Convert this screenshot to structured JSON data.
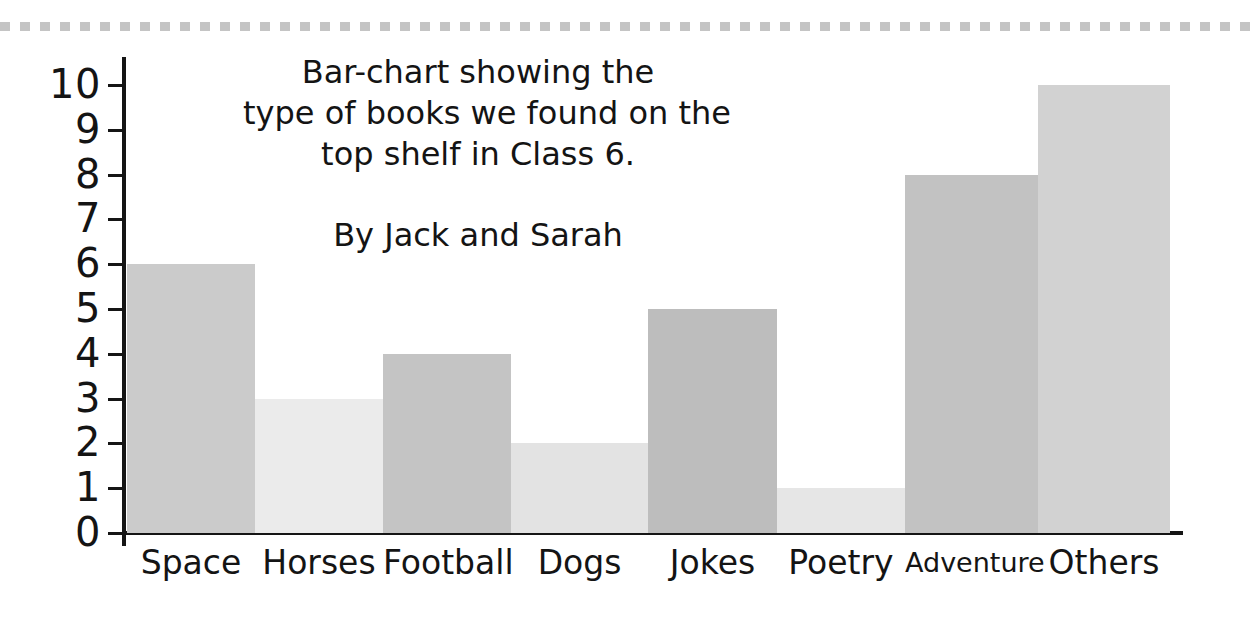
{
  "decoration": {
    "top_border_name": "dashed-border",
    "dash_color": "#c4c4c4"
  },
  "title": {
    "lines": [
      "Bar-chart showing the",
      "type of books we found on the",
      "top shelf in Class 6."
    ],
    "byline": "By Jack and Sarah"
  },
  "axes": {
    "y_ticks": [
      "10",
      "9",
      "8",
      "7",
      "6",
      "5",
      "4",
      "3",
      "2",
      "1",
      "0"
    ],
    "axis_color": "#151515"
  },
  "chart_data": {
    "type": "bar",
    "subtitle": "By Jack and Sarah",
    "xlabel": "",
    "ylabel": "",
    "categories": [
      "Space",
      "Horses",
      "Football",
      "Dogs",
      "Jokes",
      "Poetry",
      "Adventure",
      "Others"
    ],
    "values": [
      6,
      3,
      4,
      2,
      5,
      1,
      8,
      10
    ],
    "ylim": [
      0,
      10
    ],
    "ytick_step": 1,
    "grid": false,
    "legend": "none",
    "bar_colors": [
      "#cbcbcb",
      "#ebebeb",
      "#c4c4c4",
      "#e3e3e3",
      "#bdbdbd",
      "#e6e6e6",
      "#c2c2c2",
      "#d2d2d2"
    ],
    "bar_label_sizes": [
      "normal",
      "normal",
      "normal",
      "normal",
      "normal",
      "normal",
      "small",
      "normal"
    ],
    "bar_geometry": [
      {
        "left": 127,
        "width": 128
      },
      {
        "left": 255,
        "width": 128
      },
      {
        "left": 383,
        "width": 128
      },
      {
        "left": 511,
        "width": 137
      },
      {
        "left": 648,
        "width": 129
      },
      {
        "left": 777,
        "width": 128
      },
      {
        "left": 905,
        "width": 133
      },
      {
        "left": 1038,
        "width": 132
      }
    ]
  }
}
